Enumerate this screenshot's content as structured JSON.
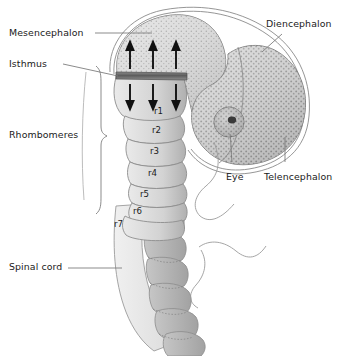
{
  "figure": {
    "background_color": "#ffffff",
    "ink_color": "#1a1a1a",
    "line_color": "#6e6e6e"
  },
  "labels": {
    "mesencephalon": "Mesencephalon",
    "isthmus": "Isthmus",
    "rhombomeres": "Rhombomeres",
    "spinal_cord": "Spinal cord",
    "diencephalon": "Diencephalon",
    "telencephalon": "Telencephalon",
    "eye": "Eye"
  },
  "rhombomeres": [
    {
      "id": "r1",
      "label": "r1"
    },
    {
      "id": "r2",
      "label": "r2"
    },
    {
      "id": "r3",
      "label": "r3"
    },
    {
      "id": "r4",
      "label": "r4"
    },
    {
      "id": "r5",
      "label": "r5"
    },
    {
      "id": "r6",
      "label": "r6"
    },
    {
      "id": "r7",
      "label": "r7"
    }
  ],
  "signals": {
    "isthmus_band_color": "#6b6b6b",
    "arrows_up": 3,
    "arrows_down": 3,
    "direction_up": "anterior",
    "direction_down": "posterior"
  },
  "colors": {
    "forebrain_fill": "#d8d8d8",
    "midbrain_fill": "#cfcfcf",
    "rhombomere_fill": "#d2d2d2",
    "spinal_fill": "#e6e6e6",
    "somite_fill": "#b3b3b3",
    "outline": "#6e6e6e"
  }
}
